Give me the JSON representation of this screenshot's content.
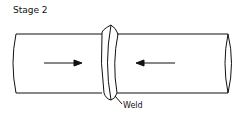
{
  "title": "Stage 2",
  "labels": {
    "weld": "Weld"
  },
  "arrows": [
    {
      "direction": "right",
      "position": "left-segment"
    },
    {
      "direction": "left",
      "position": "right-segment"
    }
  ],
  "colors": {
    "stroke": "#111111",
    "background": "#ffffff"
  }
}
